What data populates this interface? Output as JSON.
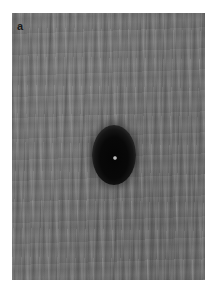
{
  "figure": {
    "panel_label": "a",
    "image": {
      "description": "grayscale textured micrograph with a dark elliptical spot",
      "background_color": "#6f6f6f",
      "spot_color": "#050505",
      "spot_core_color": "#d8d8d8"
    }
  }
}
